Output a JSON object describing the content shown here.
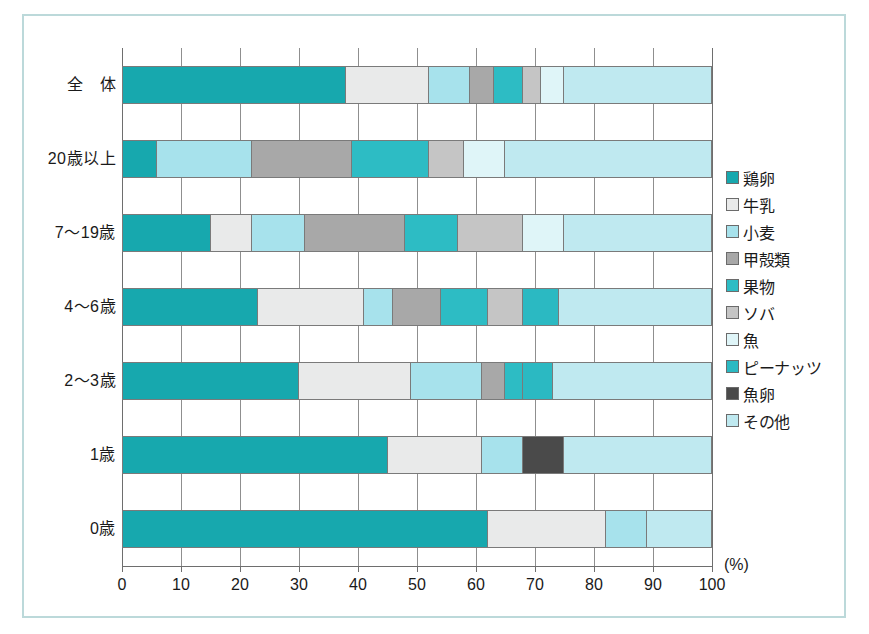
{
  "chart_data": {
    "type": "bar",
    "orientation": "horizontal",
    "stacked": true,
    "stack_mode": "percent",
    "title": "",
    "xlabel": "(%)",
    "ylabel": "",
    "xlim": [
      0,
      100
    ],
    "xticks": [
      0,
      10,
      20,
      30,
      40,
      50,
      60,
      70,
      80,
      90,
      100
    ],
    "xtick_labels": [
      "0",
      "10",
      "20",
      "30",
      "40",
      "50",
      "60",
      "70",
      "80",
      "90",
      "100"
    ],
    "grid": true,
    "grid_axis": "x",
    "legend_position": "right",
    "categories": [
      "全　体",
      "20歳以上",
      "7～19歳",
      "4～6歳",
      "2～3歳",
      "1歳",
      "0歳"
    ],
    "series": [
      {
        "name": "鶏卵",
        "color": "#17a8ae",
        "values": [
          38,
          6,
          15,
          23,
          30,
          45,
          62
        ]
      },
      {
        "name": "牛乳",
        "color": "#e9eaea",
        "values": [
          14,
          0,
          7,
          18,
          19,
          16,
          20
        ]
      },
      {
        "name": "小麦",
        "color": "#a7e2ec",
        "values": [
          7,
          16,
          9,
          5,
          12,
          7,
          7
        ]
      },
      {
        "name": "甲殻類",
        "color": "#a8a8a8",
        "values": [
          4,
          17,
          17,
          8,
          4,
          0,
          0
        ]
      },
      {
        "name": "果物",
        "color": "#2dbcc4",
        "values": [
          5,
          13,
          9,
          8,
          3,
          0,
          0
        ]
      },
      {
        "name": "ソバ",
        "color": "#c5c5c5",
        "values": [
          3,
          6,
          11,
          6,
          0,
          0,
          0
        ]
      },
      {
        "name": "魚",
        "color": "#dff5f8",
        "values": [
          4,
          7,
          7,
          0,
          0,
          0,
          0
        ]
      },
      {
        "name": "ピーナッツ",
        "color": "#2bb9c2",
        "values": [
          0,
          0,
          0,
          6,
          5,
          0,
          0
        ]
      },
      {
        "name": "魚卵",
        "color": "#4a4a4a",
        "values": [
          0,
          0,
          0,
          0,
          0,
          7,
          0
        ]
      },
      {
        "name": "その他",
        "color": "#bfe9f0",
        "values": [
          25,
          35,
          25,
          26,
          27,
          25,
          11
        ]
      }
    ]
  },
  "axis": {
    "unit_label": "(%)"
  },
  "legend": {
    "items": [
      {
        "label": "鶏卵",
        "color": "#17a8ae"
      },
      {
        "label": "牛乳",
        "color": "#e9eaea"
      },
      {
        "label": "小麦",
        "color": "#a7e2ec"
      },
      {
        "label": "甲殻類",
        "color": "#a8a8a8"
      },
      {
        "label": "果物",
        "color": "#2dbcc4"
      },
      {
        "label": "ソバ",
        "color": "#c5c5c5"
      },
      {
        "label": "魚",
        "color": "#dff5f8"
      },
      {
        "label": "ピーナッツ",
        "color": "#2bb9c2"
      },
      {
        "label": "魚卵",
        "color": "#4a4a4a"
      },
      {
        "label": "その他",
        "color": "#bfe9f0"
      }
    ]
  }
}
